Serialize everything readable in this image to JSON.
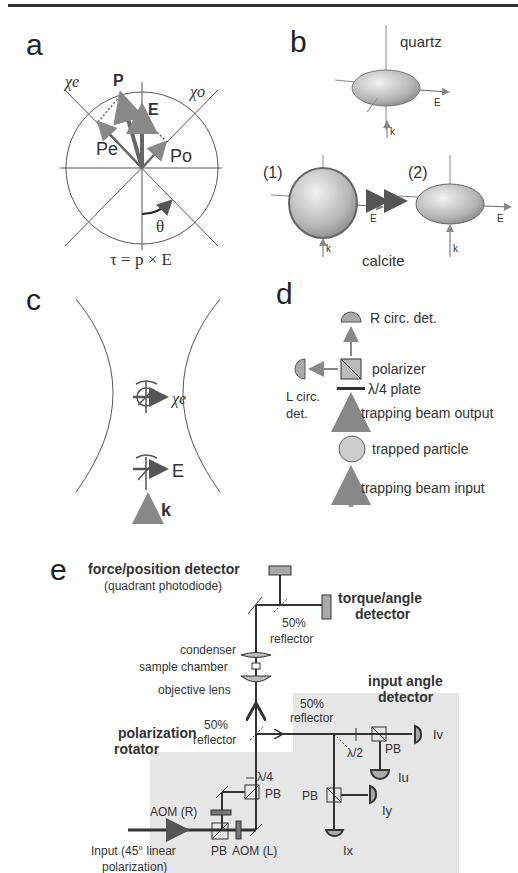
{
  "figure": {
    "panels": {
      "a": {
        "letter": "a",
        "labels": {
          "chi_e": "χe",
          "chi_o": "χo",
          "P": "P",
          "E": "E",
          "P_e": "Pe",
          "P_o": "Po",
          "theta": "θ",
          "equation": "τ = p × E"
        }
      },
      "b": {
        "letter": "b",
        "top_label": "quartz",
        "bottom_label": "calcite",
        "item1_label": "(1)",
        "item2_label": "(2)",
        "E_label": "E",
        "k_label": "k"
      },
      "c": {
        "letter": "c",
        "chi_label": "χe",
        "E_label": "E",
        "k_label": "k"
      },
      "d": {
        "letter": "d",
        "r_det": "R circ. det.",
        "polarizer": "polarizer",
        "plate": "λ/4 plate",
        "l_det_line1": "L circ.",
        "l_det_line2": "det.",
        "beam_output": "trapping beam output",
        "particle": "trapped particle",
        "beam_input": "trapping beam input"
      },
      "e": {
        "letter": "e",
        "force_detector": "force/position detector",
        "force_detector_sub": "(quadrant photodiode)",
        "torque_line1": "torque/angle",
        "torque_line2": "detector",
        "reflector_top_line1": "50%",
        "reflector_top_line2": "reflector",
        "condenser": "condenser",
        "sample_chamber": "sample chamber",
        "objective": "objective lens",
        "input_angle_line1": "input angle",
        "input_angle_line2": "detector",
        "reflector_right_line1": "50%",
        "reflector_right_line2": "reflector",
        "pol_rot_line1": "polarization",
        "pol_rot_line2": "rotator",
        "reflector_mid_line1": "50%",
        "reflector_mid_line2": "reflector",
        "lambda4": "λ/4",
        "lambda2": "λ/2",
        "pb": "PB",
        "aom_r": "AOM (R)",
        "aom_l": "AOM (L)",
        "input_line1": "Input (45° linear",
        "input_line2": "polarization)",
        "Iv": "Iv",
        "Iu": "Iu",
        "Iy": "Iy",
        "Ix": "Ix"
      }
    },
    "colors": {
      "line": "#444444",
      "arrow_gray": "#777777",
      "fill_gray": "#bbbbbb",
      "shaded_bg": "#e6e6e6"
    }
  }
}
